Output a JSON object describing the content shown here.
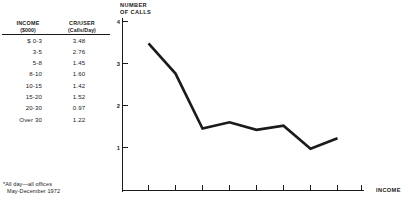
{
  "table": {
    "headers": {
      "col1_line1": "INCOME",
      "col1_line2": "($000)",
      "col2_line1": "CR/USER",
      "col2_line2": "(Calls/Day)"
    },
    "rows": [
      {
        "income": "$  0-3",
        "cr_user": "3.48"
      },
      {
        "income": "3-5",
        "cr_user": "2.76"
      },
      {
        "income": "5-8",
        "cr_user": "1.45"
      },
      {
        "income": "8-10",
        "cr_user": "1.60"
      },
      {
        "income": "10-15",
        "cr_user": "1.42"
      },
      {
        "income": "15-20",
        "cr_user": "1.52"
      },
      {
        "income": "20-30",
        "cr_user": "0.97"
      },
      {
        "income": "Over 30",
        "cr_user": "1.22"
      }
    ]
  },
  "footnote": {
    "line1": "*All day—all offices",
    "line2": "May-December 1972"
  },
  "chart_data": {
    "type": "line",
    "title": "NUMBER\nOF CALLS",
    "title_line1": "NUMBER",
    "title_line2": "OF CALLS",
    "xlabel": "INCOME",
    "ylabel": "NUMBER OF CALLS",
    "categories": [
      "$ 0-3",
      "3-5",
      "5-8",
      "8-10",
      "10-15",
      "15-20",
      "20-30",
      "Over 30"
    ],
    "values": [
      3.48,
      2.76,
      1.45,
      1.6,
      1.42,
      1.52,
      0.97,
      1.22
    ],
    "ytick_labels": [
      "4",
      "3",
      "2",
      "1"
    ],
    "ytick_values": [
      4,
      3,
      2,
      1
    ],
    "ylim": [
      0,
      4.25
    ],
    "grid": false,
    "legend": null,
    "series": [
      {
        "name": "CR/USER (Calls/Day)",
        "values": [
          3.48,
          2.76,
          1.45,
          1.6,
          1.42,
          1.52,
          0.97,
          1.22
        ]
      }
    ],
    "xtick_count": 9,
    "line_color": "#1a1a1a"
  }
}
